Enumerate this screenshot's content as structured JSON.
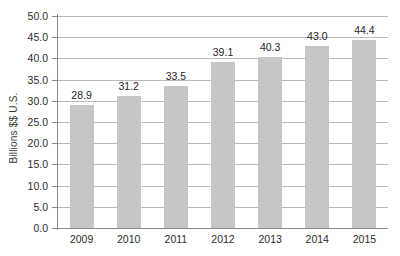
{
  "chart_data": {
    "type": "bar",
    "title": "",
    "subtitle": "",
    "xlabel": "",
    "ylabel": "Billions $$ U.S.",
    "categories": [
      "2009",
      "2010",
      "2011",
      "2012",
      "2013",
      "2014",
      "2015"
    ],
    "values": [
      28.9,
      31.2,
      33.5,
      39.1,
      40.3,
      43.0,
      44.4
    ],
    "value_labels": [
      "28.9",
      "31.2",
      "33.5",
      "39.1",
      "40.3",
      "43.0",
      "44.4"
    ],
    "ylim": [
      0.0,
      50.0
    ],
    "ytick_step": 5.0,
    "ytick_labels": [
      "50.0",
      "45.0",
      "40.0",
      "35.0",
      "30.0",
      "25.0",
      "20.0",
      "15.0",
      "10.0",
      "5.0",
      "0.0"
    ],
    "ytick_values": [
      50.0,
      45.0,
      40.0,
      35.0,
      30.0,
      25.0,
      20.0,
      15.0,
      10.0,
      5.0,
      0.0
    ],
    "grid": true,
    "grid_axis": "y",
    "legend": false,
    "legend_position": "none",
    "series": [
      {
        "name": "Billions $$ U.S.",
        "values": [
          28.9,
          31.2,
          33.5,
          39.1,
          40.3,
          43.0,
          44.4
        ]
      }
    ],
    "colors": {
      "bar_fill": "#c6c6c6",
      "gridline": "#b9b9b9",
      "axis_line": "#8a8a8a",
      "text": "#2b2b2b",
      "background": "#ffffff"
    }
  }
}
